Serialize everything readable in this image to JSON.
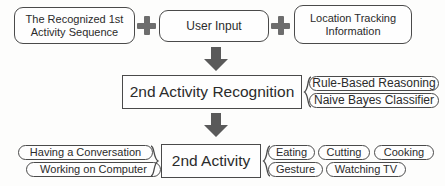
{
  "diagram": {
    "colors": {
      "stroke": "#4a4a4a",
      "text": "#2b2b2b",
      "arrow": "#5a5a5a",
      "plus": "#6d6d6d",
      "background": "#fdfdfc"
    },
    "inputs": [
      {
        "id": "recognized-first-activity",
        "lines": [
          "The Recognized 1st",
          "Activity Sequence"
        ]
      },
      {
        "id": "user-input",
        "lines": [
          "User Input"
        ]
      },
      {
        "id": "location-tracking",
        "lines": [
          "Location Tracking",
          "Information"
        ]
      }
    ],
    "operators": [
      "+",
      "+"
    ],
    "process": {
      "id": "second-activity-recognition",
      "label": "2nd Activity Recognition",
      "methods": [
        "Rule-Based Reasoning",
        "Naive Bayes Classifier"
      ]
    },
    "output": {
      "id": "second-activity",
      "label": "2nd Activity",
      "left_examples": [
        "Having a Conversation",
        "Working on Computer"
      ],
      "right_examples_row1": [
        "Eating",
        "Cutting",
        "Cooking"
      ],
      "right_examples_row2": [
        "Gesture",
        "Watching TV"
      ]
    },
    "arrows": [
      {
        "id": "arrow-inputs-to-recognition"
      },
      {
        "id": "arrow-recognition-to-activity"
      }
    ]
  }
}
